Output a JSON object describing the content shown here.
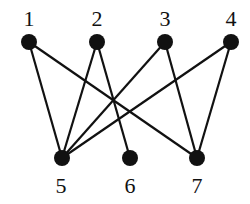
{
  "graph": {
    "type": "bipartite",
    "colors": {
      "node": "#111111",
      "edge": "#111111",
      "background": "#ffffff"
    },
    "nodes": [
      {
        "id": "1",
        "label": "1",
        "x": 29,
        "y": 42,
        "lx": 29,
        "ly": 26
      },
      {
        "id": "2",
        "label": "2",
        "x": 97,
        "y": 42,
        "lx": 97,
        "ly": 26
      },
      {
        "id": "3",
        "label": "3",
        "x": 165,
        "y": 42,
        "lx": 165,
        "ly": 26
      },
      {
        "id": "4",
        "label": "4",
        "x": 231,
        "y": 42,
        "lx": 231,
        "ly": 26
      },
      {
        "id": "5",
        "label": "5",
        "x": 62,
        "y": 158,
        "lx": 61,
        "ly": 193
      },
      {
        "id": "6",
        "label": "6",
        "x": 130,
        "y": 158,
        "lx": 130,
        "ly": 193
      },
      {
        "id": "7",
        "label": "7",
        "x": 197,
        "y": 158,
        "lx": 197,
        "ly": 193
      }
    ],
    "edges": [
      {
        "from": "1",
        "to": "5"
      },
      {
        "from": "1",
        "to": "7"
      },
      {
        "from": "2",
        "to": "5"
      },
      {
        "from": "2",
        "to": "6"
      },
      {
        "from": "3",
        "to": "5"
      },
      {
        "from": "3",
        "to": "7"
      },
      {
        "from": "4",
        "to": "5"
      },
      {
        "from": "4",
        "to": "7"
      }
    ]
  }
}
